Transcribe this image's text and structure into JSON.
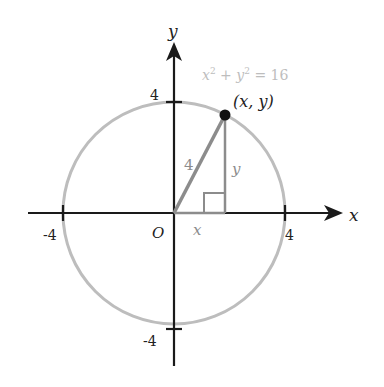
{
  "diagram": {
    "colors": {
      "axis": "#1a1a1a",
      "circle": "#bdbdbd",
      "triangle": "#8c8c8c",
      "equation": "#bdbdbd",
      "point": "#111111",
      "text": "#222222"
    },
    "axes": {
      "x_label": "x",
      "y_label": "y",
      "origin_label": "O"
    },
    "ticks": {
      "x_pos": "4",
      "x_neg": "-4",
      "y_pos": "4",
      "y_neg": "-4"
    },
    "circle": {
      "equation_parts": {
        "x": "x",
        "sup1": "2",
        "plus": " + ",
        "y": "y",
        "sup2": "2",
        "eq": " = 16"
      },
      "radius": 4
    },
    "point": {
      "label": "(x, y)"
    },
    "triangle": {
      "hypotenuse_label": "4",
      "vertical_leg_label": "y",
      "horizontal_leg_label": "x"
    }
  }
}
